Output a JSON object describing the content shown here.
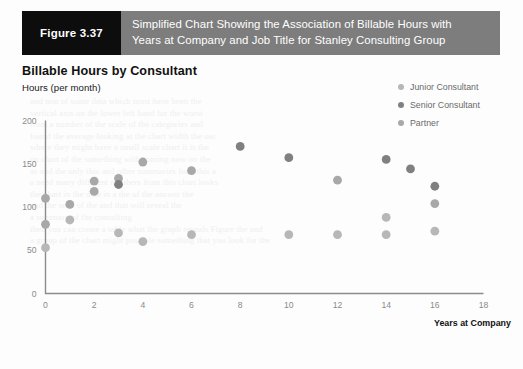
{
  "banner": {
    "figure_tag": "Figure 3.37",
    "title_line1": "Simplified Chart Showing the Association of Billable Hours with",
    "title_line2": "Years at Company and Job Title for Stanley Consulting Group",
    "tag_bg": "#0d0d0d",
    "bar_bg": "#7d7d7d"
  },
  "chart_data": {
    "type": "scatter",
    "title": "Billable Hours by Consultant",
    "ylabel": "Hours (per month)",
    "xlabel": "Years at Company",
    "xlim": [
      0,
      18
    ],
    "ylim": [
      0,
      200
    ],
    "xticks": [
      0,
      2,
      4,
      6,
      8,
      10,
      12,
      14,
      16,
      18
    ],
    "yticks": [
      0,
      50,
      100,
      150,
      200
    ],
    "grid": false,
    "legend_position": "top-right",
    "series": [
      {
        "name": "Junior Consultant",
        "color": "#b7b7b7",
        "points": [
          [
            0,
            53
          ],
          [
            1,
            85
          ],
          [
            3,
            70
          ],
          [
            4,
            60
          ],
          [
            6,
            68
          ],
          [
            10,
            68
          ],
          [
            12,
            68
          ],
          [
            14,
            68
          ],
          [
            14,
            88
          ],
          [
            16,
            72
          ]
        ]
      },
      {
        "name": "Senior Consultant",
        "color": "#808080",
        "points": [
          [
            3,
            126
          ],
          [
            8,
            170
          ],
          [
            10,
            157
          ],
          [
            14,
            155
          ],
          [
            15,
            144
          ],
          [
            16,
            124
          ]
        ]
      },
      {
        "name": "Partner",
        "color": "#a8a8a8",
        "points": [
          [
            0,
            110
          ],
          [
            0,
            80
          ],
          [
            1,
            103
          ],
          [
            2,
            118
          ],
          [
            2,
            130
          ],
          [
            3,
            133
          ],
          [
            4,
            152
          ],
          [
            6,
            142
          ],
          [
            12,
            131
          ],
          [
            16,
            104
          ]
        ]
      }
    ]
  }
}
